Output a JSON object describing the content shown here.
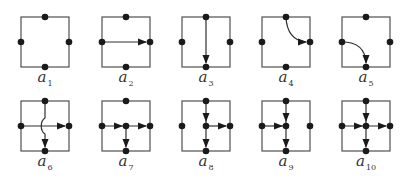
{
  "figure": {
    "colors": {
      "frame": "#505050",
      "node": "#1a1a1a",
      "label": "#333333"
    },
    "cells": [
      {
        "id": "a1",
        "symbol": "a",
        "subscript": "1",
        "row": 0,
        "col": 0,
        "nodes": [
          "top",
          "left",
          "right",
          "bottom"
        ],
        "edges": []
      },
      {
        "id": "a2",
        "symbol": "a",
        "subscript": "2",
        "row": 0,
        "col": 1,
        "nodes": [
          "top",
          "left",
          "right",
          "bottom"
        ],
        "edges": [
          {
            "from": "left",
            "to": "right",
            "shape": "straight"
          }
        ]
      },
      {
        "id": "a3",
        "symbol": "a",
        "subscript": "3",
        "row": 0,
        "col": 2,
        "nodes": [
          "top",
          "left",
          "right",
          "bottom"
        ],
        "edges": [
          {
            "from": "top",
            "to": "bottom",
            "shape": "straight"
          }
        ]
      },
      {
        "id": "a4",
        "symbol": "a",
        "subscript": "4",
        "row": 0,
        "col": 3,
        "nodes": [
          "top",
          "left",
          "right",
          "bottom"
        ],
        "edges": [
          {
            "from": "top",
            "to": "right",
            "shape": "curve"
          }
        ]
      },
      {
        "id": "a5",
        "symbol": "a",
        "subscript": "5",
        "row": 0,
        "col": 4,
        "nodes": [
          "top",
          "left",
          "right",
          "bottom"
        ],
        "edges": [
          {
            "from": "left",
            "to": "bottom",
            "shape": "curve"
          }
        ]
      },
      {
        "id": "a6",
        "symbol": "a",
        "subscript": "6",
        "row": 1,
        "col": 0,
        "nodes": [
          "top",
          "left",
          "right",
          "bottom"
        ],
        "edges": [
          {
            "from": "left",
            "to": "right",
            "shape": "straight"
          },
          {
            "from": "top",
            "to": "bottom",
            "shape": "crossover"
          }
        ]
      },
      {
        "id": "a7",
        "symbol": "a",
        "subscript": "7",
        "row": 1,
        "col": 1,
        "nodes": [
          "top",
          "left",
          "center",
          "right",
          "bottom"
        ],
        "edges": [
          {
            "from": "left",
            "to": "center"
          },
          {
            "from": "center",
            "to": "right"
          },
          {
            "from": "center",
            "to": "bottom"
          }
        ]
      },
      {
        "id": "a8",
        "symbol": "a",
        "subscript": "8",
        "row": 1,
        "col": 2,
        "nodes": [
          "top",
          "left",
          "center",
          "right",
          "bottom"
        ],
        "edges": [
          {
            "from": "top",
            "to": "center"
          },
          {
            "from": "center",
            "to": "right"
          },
          {
            "from": "center",
            "to": "bottom"
          }
        ]
      },
      {
        "id": "a9",
        "symbol": "a",
        "subscript": "9",
        "row": 1,
        "col": 3,
        "nodes": [
          "top",
          "left",
          "center",
          "right",
          "bottom"
        ],
        "edges": [
          {
            "from": "top",
            "to": "center"
          },
          {
            "from": "left",
            "to": "center"
          },
          {
            "from": "center",
            "to": "bottom"
          }
        ]
      },
      {
        "id": "a10",
        "symbol": "a",
        "subscript": "10",
        "row": 1,
        "col": 4,
        "nodes": [
          "top",
          "left",
          "center",
          "right",
          "bottom"
        ],
        "edges": [
          {
            "from": "top",
            "to": "center"
          },
          {
            "from": "left",
            "to": "center"
          },
          {
            "from": "center",
            "to": "right"
          },
          {
            "from": "center",
            "to": "bottom"
          }
        ]
      }
    ]
  }
}
